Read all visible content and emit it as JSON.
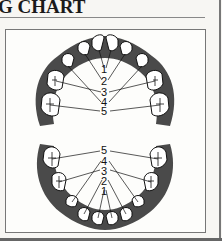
{
  "header": {
    "title": "G CHART"
  },
  "diagram": {
    "type": "dental-arch-teething-chart",
    "upper_arch": {
      "labels": [
        "1",
        "2",
        "3",
        "4",
        "5"
      ]
    },
    "lower_arch": {
      "labels": [
        "5",
        "4",
        "3",
        "2",
        "1"
      ]
    },
    "colors": {
      "gum": "#4a4a4a",
      "tooth": "#ffffff",
      "line": "#111111"
    }
  }
}
